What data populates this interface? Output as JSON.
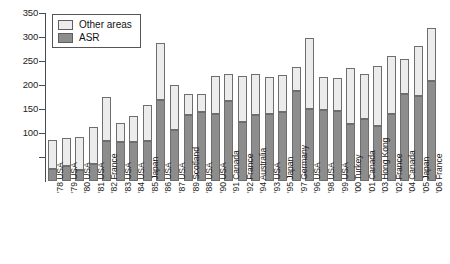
{
  "chart_data": {
    "type": "bar",
    "subtype": "stacked-vertical",
    "title": "",
    "subtitle": "",
    "xlabel": "",
    "ylabel": "",
    "ylim": [
      0,
      350
    ],
    "y_ticks": [
      50,
      100,
      150,
      200,
      250,
      300,
      350
    ],
    "y_tick_labels": [
      "",
      "100",
      "150",
      "200",
      "250",
      "300",
      "350"
    ],
    "y_tick_interval": 50,
    "grid": false,
    "legend_position": "upper-left",
    "legend": [
      "Other areas",
      "ASR"
    ],
    "colors": {
      "other_areas": "#ececec",
      "asr": "#8d8d8d",
      "bar_outline": "#6e6e6e",
      "axis": "#4a4a55",
      "text": "#1d1d1d",
      "background": "#ffffff"
    },
    "categories": [
      "'78 USA",
      "'79 USA",
      "'80 USA",
      "'81 USA",
      "'82 France",
      "'83 USA",
      "'84 USA",
      "'85 Japan",
      "'86 USA",
      "'87 USA",
      "'89 Scotland",
      "'88 USA",
      "'90 USA",
      "'91 Canada",
      "'92 France",
      "'94 Australia",
      "'93 USA",
      "'95 Japan",
      "'97 Germany",
      "'96 USA",
      "'98 USA",
      "'99 USA",
      "'00 Turkey",
      "'01 Canada",
      "'03 Hong Kong",
      "'02 France",
      "'04 Canada",
      "'05 Japan",
      "'06 France"
    ],
    "series": [
      {
        "name": "ASR",
        "values": [
          25,
          32,
          22,
          35,
          83,
          82,
          81,
          83,
          168,
          107,
          137,
          143,
          140,
          167,
          123,
          137,
          140,
          143,
          187,
          150,
          147,
          145,
          118,
          129,
          115,
          140,
          182,
          178,
          208
        ]
      },
      {
        "name": "Other areas",
        "values": [
          60,
          57,
          69,
          78,
          93,
          38,
          55,
          75,
          120,
          92,
          44,
          38,
          78,
          56,
          95,
          87,
          77,
          77,
          51,
          148,
          70,
          69,
          118,
          94,
          125,
          120,
          73,
          103,
          110
        ]
      }
    ],
    "totals": [
      85,
      89,
      91,
      113,
      176,
      120,
      136,
      158,
      288,
      199,
      181,
      181,
      218,
      223,
      218,
      224,
      217,
      220,
      238,
      298,
      217,
      214,
      236,
      223,
      240,
      260,
      255,
      281,
      318
    ]
  }
}
